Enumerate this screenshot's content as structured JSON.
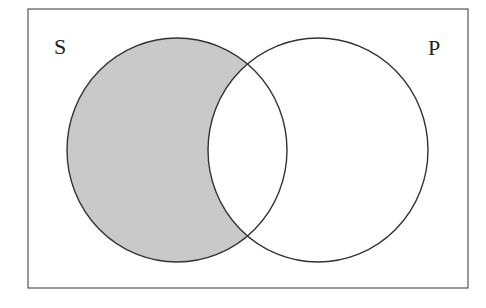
{
  "diagram": {
    "type": "venn",
    "sets": [
      {
        "id": "S",
        "label": "S",
        "shaded": "S-only (S minus P)"
      },
      {
        "id": "P",
        "label": "P",
        "shaded": "none"
      }
    ],
    "colors": {
      "shade": "#c9c9c9",
      "stroke": "#333333",
      "frame": "#555555",
      "background": "#ffffff"
    }
  }
}
